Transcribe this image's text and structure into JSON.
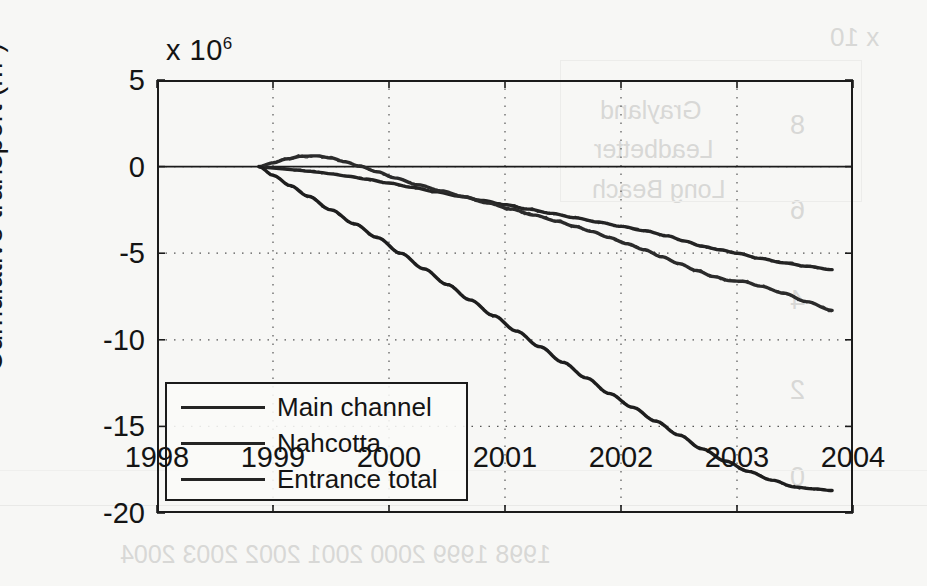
{
  "figure": {
    "exponent_label": "x 10",
    "exponent_power": "6",
    "ylabel_text": "Cumulative transport (m",
    "ylabel_sup": "3",
    "ylabel_close": ")"
  },
  "chart_data": {
    "type": "line",
    "title": "",
    "xlabel": "",
    "ylabel": "Cumulative transport (m3)",
    "y_exponent": 1000000,
    "xlim": [
      1998,
      2004
    ],
    "ylim": [
      -20,
      5
    ],
    "xticks": [
      1998,
      1999,
      2000,
      2001,
      2002,
      2003,
      2004
    ],
    "yticks": [
      5,
      0,
      -5,
      -10,
      -15,
      -20
    ],
    "xtick_labels": [
      "1998",
      "1999",
      "2000",
      "2001",
      "2002",
      "2003",
      "2004"
    ],
    "ytick_labels": [
      "5",
      "0",
      "-5",
      "-10",
      "-15",
      "-20"
    ],
    "grid": "dotted",
    "legend_position": "lower left",
    "series": [
      {
        "name": "Main channel",
        "color": "#242424",
        "x": [
          1998.88,
          1999.0,
          1999.1,
          1999.2,
          1999.3,
          1999.4,
          1999.5,
          1999.65,
          1999.8,
          2000.0,
          2000.2,
          2000.4,
          2000.6,
          2000.8,
          2001.0,
          2001.2,
          2001.4,
          2001.6,
          2001.8,
          2002.0,
          2002.2,
          2002.4,
          2002.55,
          2002.7,
          2002.85,
          2003.0,
          2003.2,
          2003.4,
          2003.6,
          2003.82
        ],
        "y": [
          0.0,
          -0.08,
          -0.14,
          -0.2,
          -0.26,
          -0.33,
          -0.42,
          -0.56,
          -0.72,
          -0.95,
          -1.2,
          -1.45,
          -1.7,
          -1.95,
          -2.2,
          -2.45,
          -2.7,
          -2.95,
          -3.2,
          -3.45,
          -3.7,
          -4.0,
          -4.3,
          -4.6,
          -4.8,
          -5.0,
          -5.3,
          -5.55,
          -5.75,
          -5.95
        ]
      },
      {
        "name": "Nahcotta",
        "color": "#2b2b2b",
        "x": [
          1998.88,
          1999.0,
          1999.12,
          1999.25,
          1999.38,
          1999.5,
          1999.62,
          1999.75,
          1999.9,
          2000.05,
          2000.25,
          2000.45,
          2000.65,
          2000.85,
          2001.05,
          2001.25,
          2001.45,
          2001.6,
          2001.75,
          2001.9,
          2002.05,
          2002.2,
          2002.35,
          2002.5,
          2002.65,
          2002.8,
          2002.95,
          2003.05,
          2003.2,
          2003.4,
          2003.6,
          2003.82
        ],
        "y": [
          0.0,
          0.22,
          0.45,
          0.6,
          0.62,
          0.5,
          0.28,
          0.02,
          -0.3,
          -0.65,
          -1.05,
          -1.4,
          -1.75,
          -2.1,
          -2.45,
          -2.8,
          -3.15,
          -3.45,
          -3.75,
          -4.1,
          -4.45,
          -4.8,
          -5.2,
          -5.6,
          -6.0,
          -6.35,
          -6.6,
          -6.62,
          -6.9,
          -7.3,
          -7.8,
          -8.3
        ]
      },
      {
        "name": "Entrance total",
        "color": "#1e1e1e",
        "x": [
          1998.88,
          1999.0,
          1999.15,
          1999.3,
          1999.5,
          1999.7,
          1999.9,
          2000.1,
          2000.3,
          2000.5,
          2000.7,
          2000.9,
          2001.1,
          2001.3,
          2001.5,
          2001.7,
          2001.9,
          2002.1,
          2002.3,
          2002.5,
          2002.7,
          2002.9,
          2003.1,
          2003.3,
          2003.5,
          2003.65,
          2003.82
        ],
        "y": [
          0.0,
          -0.5,
          -1.1,
          -1.7,
          -2.5,
          -3.3,
          -4.1,
          -5.0,
          -5.9,
          -6.8,
          -7.7,
          -8.6,
          -9.5,
          -10.4,
          -11.3,
          -12.2,
          -13.1,
          -13.9,
          -14.7,
          -15.5,
          -16.3,
          -17.0,
          -17.6,
          -18.1,
          -18.5,
          -18.6,
          -18.7
        ]
      }
    ]
  },
  "legend": {
    "items": [
      {
        "label": "Main channel"
      },
      {
        "label": "Nahcotta"
      },
      {
        "label": "Entrance total"
      }
    ]
  },
  "bleed_through": {
    "items": [
      {
        "text": "x 10",
        "left": 830,
        "top": 22,
        "size": 26
      },
      {
        "text": "8",
        "left": 790,
        "top": 110,
        "size": 27
      },
      {
        "text": "6",
        "left": 790,
        "top": 195,
        "size": 27
      },
      {
        "text": "4",
        "left": 790,
        "top": 285,
        "size": 27
      },
      {
        "text": "2",
        "left": 790,
        "top": 375,
        "size": 27
      },
      {
        "text": "0",
        "left": 790,
        "top": 462,
        "size": 27
      },
      {
        "text": "Grayland",
        "left": 600,
        "top": 96,
        "size": 25
      },
      {
        "text": "Leadbetter",
        "left": 594,
        "top": 135,
        "size": 25
      },
      {
        "text": "Long Beach",
        "left": 592,
        "top": 175,
        "size": 25
      },
      {
        "text": "Cumulative transport (m",
        "left": 872,
        "top": 170,
        "size": 24,
        "rotate": -90
      },
      {
        "text": "1998 1999 2000 2001 2002 2003 2004",
        "left": 120,
        "top": 540,
        "size": 25
      }
    ]
  }
}
